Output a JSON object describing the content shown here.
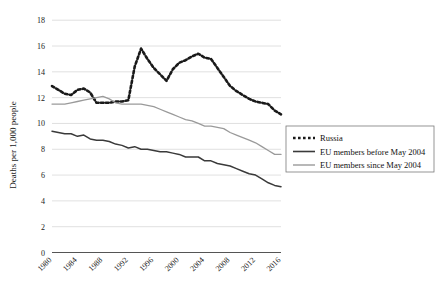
{
  "chart_data": {
    "type": "line",
    "title": "",
    "xlabel": "",
    "ylabel": "Deaths per 1,000 people",
    "xlim": [
      1980,
      2016
    ],
    "ylim": [
      0,
      18
    ],
    "ytick_step": 2,
    "grid": true,
    "legend_position": "right-middle",
    "yticks": [
      "0",
      "2",
      "4",
      "6",
      "8",
      "10",
      "12",
      "14",
      "16",
      "18"
    ],
    "xticks": [
      "1980",
      "1984",
      "1988",
      "1992",
      "1996",
      "2000",
      "2004",
      "2008",
      "2012",
      "2016"
    ],
    "x": [
      1980,
      1981,
      1982,
      1983,
      1984,
      1985,
      1986,
      1987,
      1988,
      1989,
      1990,
      1991,
      1992,
      1993,
      1994,
      1995,
      1996,
      1997,
      1998,
      1999,
      2000,
      2001,
      2002,
      2003,
      2004,
      2005,
      2006,
      2007,
      2008,
      2009,
      2010,
      2011,
      2012,
      2013,
      2014,
      2015,
      2016
    ],
    "series": [
      {
        "name": "Russia",
        "style": "dotted",
        "color": "#1a1a1a",
        "values": [
          12.9,
          12.6,
          12.3,
          12.2,
          12.6,
          12.7,
          12.4,
          11.6,
          11.6,
          11.6,
          11.7,
          11.7,
          11.8,
          14.4,
          15.8,
          15.0,
          14.3,
          13.8,
          13.3,
          14.2,
          14.7,
          14.9,
          15.2,
          15.4,
          15.1,
          15.0,
          14.3,
          13.6,
          12.9,
          12.5,
          12.2,
          11.9,
          11.7,
          11.6,
          11.5,
          11.0,
          10.7
        ]
      },
      {
        "name": "EU members before May 2004",
        "style": "solid-dark",
        "color": "#3a3a3a",
        "values": [
          9.4,
          9.3,
          9.2,
          9.2,
          9.0,
          9.1,
          8.8,
          8.7,
          8.7,
          8.6,
          8.4,
          8.3,
          8.1,
          8.2,
          8.0,
          8.0,
          7.9,
          7.8,
          7.8,
          7.7,
          7.6,
          7.4,
          7.4,
          7.4,
          7.1,
          7.1,
          6.9,
          6.8,
          6.7,
          6.5,
          6.3,
          6.1,
          6.0,
          5.7,
          5.4,
          5.2,
          5.1
        ]
      },
      {
        "name": "EU members since May 2004",
        "style": "solid-gray",
        "color": "#9a9a9a",
        "values": [
          11.5,
          11.5,
          11.5,
          11.6,
          11.7,
          11.8,
          11.9,
          12.0,
          12.1,
          11.9,
          11.6,
          11.5,
          11.5,
          11.5,
          11.5,
          11.4,
          11.3,
          11.1,
          10.9,
          10.7,
          10.5,
          10.3,
          10.2,
          10.0,
          9.8,
          9.8,
          9.7,
          9.6,
          9.3,
          9.1,
          8.9,
          8.7,
          8.5,
          8.2,
          7.9,
          7.6,
          7.6
        ]
      }
    ],
    "legend": [
      {
        "label": "Russia",
        "marker": "dotted"
      },
      {
        "label": "EU members before May 2004",
        "marker": "solid-dark"
      },
      {
        "label": "EU members since May 2004",
        "marker": "solid-gray"
      }
    ]
  }
}
